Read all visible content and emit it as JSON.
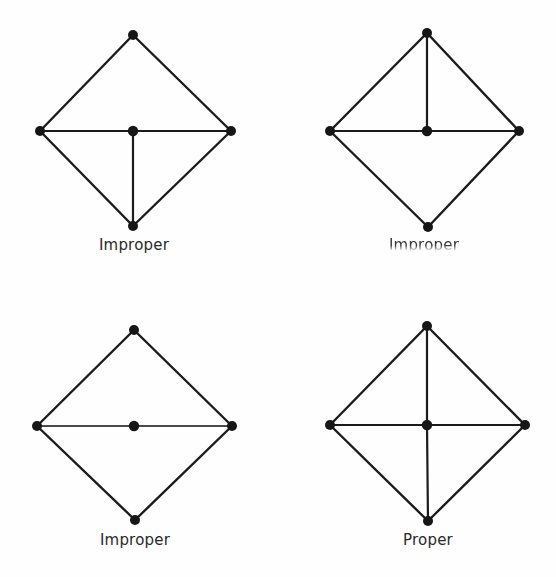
{
  "figure": {
    "background_color": "#fefefe",
    "ink_color": "#1b1b1b",
    "node_color": "#161616"
  },
  "panels": [
    {
      "id": "top-left",
      "label": "Improper",
      "label_degraded": false,
      "vertices": {
        "top": {
          "x": 133,
          "y": 35
        },
        "left": {
          "x": 40,
          "y": 131
        },
        "right": {
          "x": 231,
          "y": 131
        },
        "bottom": {
          "x": 133,
          "y": 226
        },
        "center": {
          "x": 133,
          "y": 131
        }
      },
      "outline": [
        "top-left",
        "left-bottom",
        "bottom-right",
        "right-top"
      ],
      "interior_edges": [
        {
          "from": "left",
          "to": "center",
          "style": "solid"
        },
        {
          "from": "center",
          "to": "right",
          "style": "solid"
        },
        {
          "from": "center",
          "to": "bottom",
          "style": "solid"
        }
      ],
      "center_degree": 3,
      "has_vertical_upper": false,
      "has_vertical_lower": true,
      "has_horizontal": true
    },
    {
      "id": "top-right",
      "label": "Improper",
      "label_degraded": true,
      "vertices": {
        "top": {
          "x": 427,
          "y": 33
        },
        "left": {
          "x": 330,
          "y": 131
        },
        "right": {
          "x": 519,
          "y": 131
        },
        "bottom": {
          "x": 428,
          "y": 227
        },
        "center": {
          "x": 427,
          "y": 131
        }
      },
      "outline": [
        "top-left",
        "left-bottom",
        "bottom-right",
        "right-top"
      ],
      "interior_edges": [
        {
          "from": "left",
          "to": "center",
          "style": "solid"
        },
        {
          "from": "center",
          "to": "right",
          "style": "solid"
        },
        {
          "from": "top",
          "to": "center",
          "style": "solid"
        }
      ],
      "center_degree": 3,
      "has_vertical_upper": true,
      "has_vertical_lower": false,
      "has_horizontal": true
    },
    {
      "id": "bottom-left",
      "label": "Improper",
      "label_degraded": false,
      "vertices": {
        "top": {
          "x": 134,
          "y": 330
        },
        "left": {
          "x": 37,
          "y": 426
        },
        "right": {
          "x": 232,
          "y": 426
        },
        "bottom": {
          "x": 135,
          "y": 520
        },
        "center": {
          "x": 134,
          "y": 426
        }
      },
      "outline": [
        "top-left",
        "left-bottom",
        "bottom-right",
        "right-top"
      ],
      "interior_edges": [
        {
          "from": "left",
          "to": "center",
          "style": "faded"
        },
        {
          "from": "center",
          "to": "right",
          "style": "faded"
        }
      ],
      "center_degree": 2,
      "has_vertical_upper": false,
      "has_vertical_lower": false,
      "has_horizontal": true
    },
    {
      "id": "bottom-right",
      "label": "Proper",
      "label_degraded": false,
      "vertices": {
        "top": {
          "x": 427,
          "y": 326
        },
        "left": {
          "x": 330,
          "y": 425
        },
        "right": {
          "x": 525,
          "y": 425
        },
        "bottom": {
          "x": 428,
          "y": 521
        },
        "center": {
          "x": 427,
          "y": 425
        }
      },
      "outline": [
        "top-left",
        "left-bottom",
        "bottom-right",
        "right-top"
      ],
      "interior_edges": [
        {
          "from": "left",
          "to": "center",
          "style": "solid"
        },
        {
          "from": "center",
          "to": "right",
          "style": "solid"
        },
        {
          "from": "top",
          "to": "center",
          "style": "solid"
        },
        {
          "from": "center",
          "to": "bottom",
          "style": "solid"
        }
      ],
      "center_degree": 4,
      "has_vertical_upper": true,
      "has_vertical_lower": true,
      "has_horizontal": true
    }
  ]
}
